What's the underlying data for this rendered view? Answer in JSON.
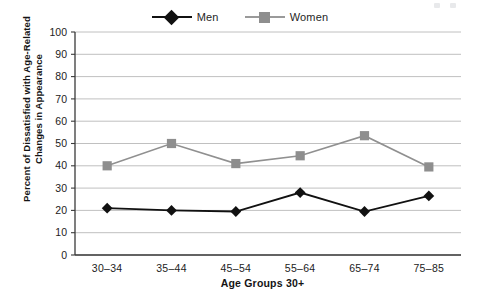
{
  "legend": {
    "position": "top-center",
    "entries": [
      {
        "label": "Men",
        "marker": "diamond",
        "color": "#111111"
      },
      {
        "label": "Women",
        "marker": "square",
        "color": "#8e8e8e"
      }
    ]
  },
  "axes": {
    "y_title": "Percent of Dissatisfied with Age-Related Changes in Appearance",
    "x_title": "Age Groups 30+",
    "y_ticks": [
      "100",
      "90",
      "80",
      "70",
      "60",
      "50",
      "40",
      "30",
      "20",
      "10",
      "0"
    ],
    "x_ticks": [
      "30–34",
      "35–44",
      "45–54",
      "55–64",
      "65–74",
      "75–85"
    ]
  },
  "chart_data": {
    "type": "line",
    "title": "",
    "subtitle": "",
    "xlabel": "Age Groups 30+",
    "ylabel": "Percent of Dissatisfied with Age-Related Changes in Appearance",
    "categories": [
      "30–34",
      "35–44",
      "45–54",
      "55–64",
      "65–74",
      "75–85"
    ],
    "series": [
      {
        "name": "Men",
        "color": "#111111",
        "marker": "diamond",
        "values": [
          21,
          20,
          19.5,
          28,
          19.5,
          26.5
        ]
      },
      {
        "name": "Women",
        "color": "#8e8e8e",
        "marker": "square",
        "values": [
          40,
          50,
          41,
          44.5,
          53.5,
          39.5
        ]
      }
    ],
    "ylim": [
      0,
      100
    ],
    "ytick_step": 10,
    "grid": true,
    "grid_axis": "y",
    "legend_position": "top-center"
  }
}
